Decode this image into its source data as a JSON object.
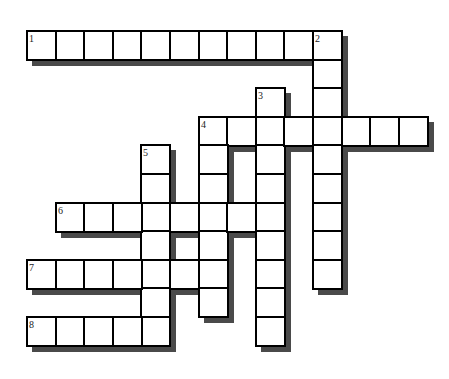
{
  "puzzle": {
    "type": "crossword",
    "grid": {
      "origin_x": 26,
      "origin_y": 30,
      "cell_size": 28.6,
      "shadow_offset": 6,
      "shadow_color": "#4a4a4a",
      "border_color": "#000000",
      "cell_fill": "#ffffff"
    },
    "entries": [
      {
        "number": "1",
        "direction": "across",
        "row": 0,
        "col": 0,
        "length": 11
      },
      {
        "number": "2",
        "direction": "down",
        "row": 0,
        "col": 10,
        "length": 9
      },
      {
        "number": "3",
        "direction": "down",
        "row": 2,
        "col": 8,
        "length": 9
      },
      {
        "number": "4",
        "direction": "across",
        "row": 3,
        "col": 6,
        "length": 8
      },
      {
        "number": "4",
        "direction": "down",
        "row": 3,
        "col": 6,
        "length": 7
      },
      {
        "number": "5",
        "direction": "down",
        "row": 4,
        "col": 4,
        "length": 7
      },
      {
        "number": "6",
        "direction": "across",
        "row": 6,
        "col": 1,
        "length": 8
      },
      {
        "number": "7",
        "direction": "across",
        "row": 8,
        "col": 0,
        "length": 7
      },
      {
        "number": "8",
        "direction": "across",
        "row": 10,
        "col": 0,
        "length": 5
      }
    ]
  }
}
